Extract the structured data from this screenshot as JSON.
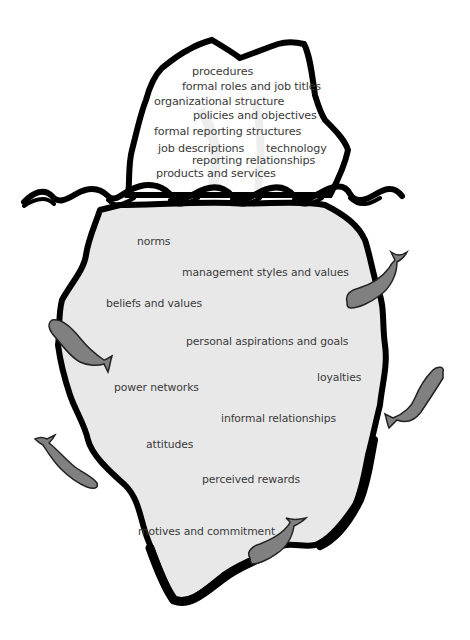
{
  "diagram": {
    "colors": {
      "background": "#ffffff",
      "outline": "#000000",
      "iceberg_above_fill": "#ffffff",
      "iceberg_below_fill": "#e8e8e8",
      "whale_fill": "#808080",
      "text": "#3a3a3a"
    },
    "above_water": {
      "label": "formal / visible aspects",
      "items": [
        {
          "text": "procedures",
          "x": 192,
          "y": 66
        },
        {
          "text": "formal roles and job titles",
          "x": 182,
          "y": 81
        },
        {
          "text": "organizational structure",
          "x": 154,
          "y": 96
        },
        {
          "text": "policies and objectives",
          "x": 193,
          "y": 110
        },
        {
          "text": "formal reporting structures",
          "x": 154,
          "y": 126
        },
        {
          "text": "job descriptions",
          "x": 158,
          "y": 143
        },
        {
          "text": "technology",
          "x": 266,
          "y": 143
        },
        {
          "text": "reporting relationships",
          "x": 192,
          "y": 155
        },
        {
          "text": "products and services",
          "x": 156,
          "y": 168
        }
      ]
    },
    "below_water": {
      "label": "informal / hidden aspects",
      "items": [
        {
          "text": "norms",
          "x": 137,
          "y": 237
        },
        {
          "text": "management styles and values",
          "x": 182,
          "y": 268
        },
        {
          "text": "beliefs and values",
          "x": 106,
          "y": 299
        },
        {
          "text": "personal aspirations and goals",
          "x": 186,
          "y": 337
        },
        {
          "text": "loyalties",
          "x": 317,
          "y": 373
        },
        {
          "text": "power networks",
          "x": 114,
          "y": 383
        },
        {
          "text": "informal relationships",
          "x": 221,
          "y": 414
        },
        {
          "text": "attitudes",
          "x": 146,
          "y": 440
        },
        {
          "text": "perceived rewards",
          "x": 202,
          "y": 475
        },
        {
          "text": "motives and commitment",
          "x": 138,
          "y": 527
        }
      ]
    },
    "whales": [
      {
        "name": "whale-right-upper",
        "x": 345,
        "y": 258
      },
      {
        "name": "whale-right-lower",
        "x": 385,
        "y": 368
      },
      {
        "name": "whale-left-upper",
        "x": 48,
        "y": 318
      },
      {
        "name": "whale-left-lower",
        "x": 35,
        "y": 433
      },
      {
        "name": "whale-bottom",
        "x": 248,
        "y": 518
      }
    ]
  }
}
